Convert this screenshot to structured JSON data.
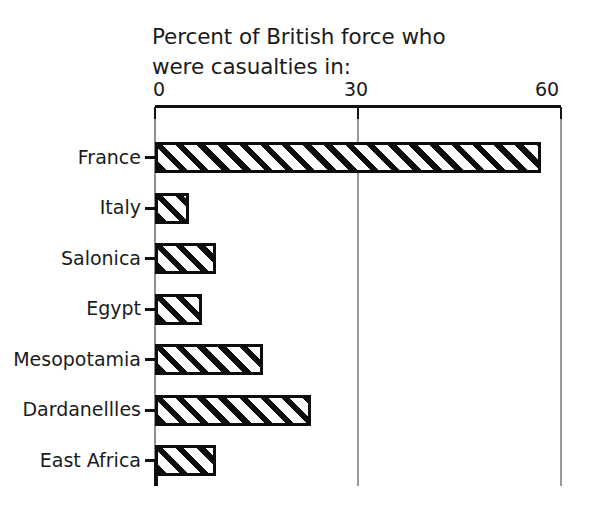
{
  "chart_data": {
    "type": "bar",
    "orientation": "horizontal",
    "title": "Percent of British force who\nwere casualties in:",
    "title_line1": "Percent of British force who",
    "title_line2": "were casualties in:",
    "xlabel": "",
    "ylabel": "",
    "xlim": [
      0,
      60
    ],
    "xticks": [
      0,
      30,
      60
    ],
    "xtick_labels": [
      "0",
      "30",
      "60"
    ],
    "grid": "vertical gridlines at 0, 30, 60",
    "legend": "none",
    "axis_position": "top",
    "categories": [
      "France",
      "Italy",
      "Salonica",
      "Egypt",
      "Mesopotamia",
      "Dardanellles",
      "East Africa"
    ],
    "values": [
      57,
      5,
      9,
      7,
      16,
      23,
      9
    ],
    "bar_style": {
      "fill": "diagonal hatch",
      "hatch_color": "#0d0d0d",
      "background": "#ffffff",
      "border_color": "#0d0d0d"
    },
    "colors": {
      "background": "#ffffff",
      "text": "#1b1b1b",
      "axis": "#111111",
      "gridline": "#9a9a9a"
    }
  }
}
